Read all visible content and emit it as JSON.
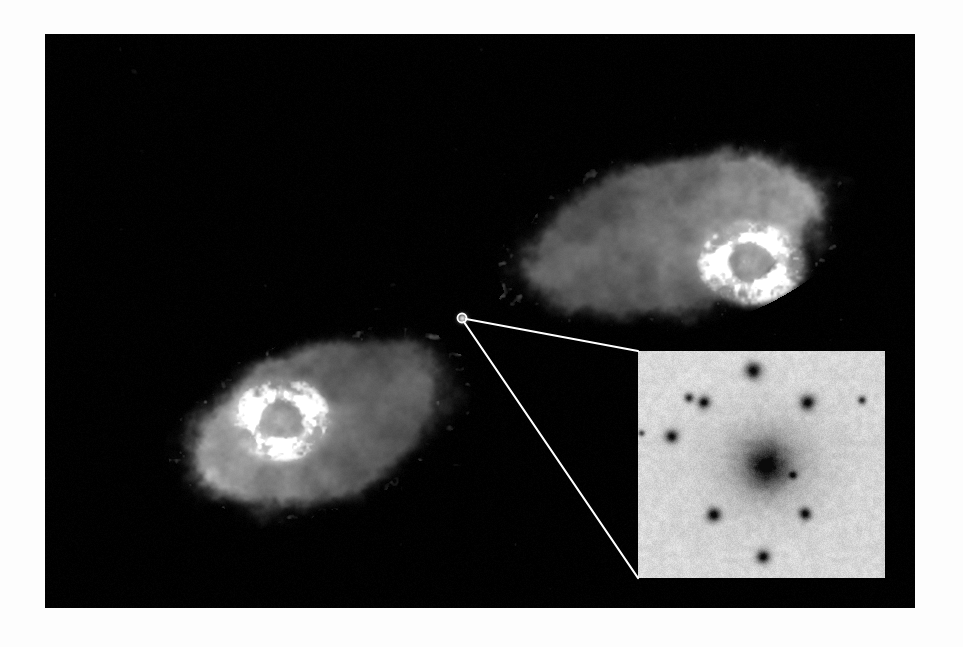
{
  "figure": {
    "kind": "astronomical-image",
    "description": "Greyscale radio map of a double-lobed radio galaxy with an optical inset of the host galaxy",
    "background_color": "#ffffff",
    "frame": {
      "x": 45,
      "y": 34,
      "width": 870,
      "height": 574,
      "background_color": "#000000",
      "border_color": "#000000"
    },
    "visible_text": [],
    "annotations": {
      "core_marker": {
        "label": "radio-core-marker",
        "shape": "small open circle",
        "x": 417,
        "y": 284,
        "radius": 4.5,
        "color": "#ffffff"
      },
      "callout_lines": {
        "label": "inset-callout-lines",
        "color": "#ffffff",
        "width": 2.2,
        "lines": [
          {
            "x1": 421,
            "y1": 285,
            "x2": 593,
            "y2": 317
          },
          {
            "x1": 419,
            "y1": 288,
            "x2": 593,
            "y2": 544
          }
        ]
      }
    },
    "radio_map": {
      "label": "radio-continuum-map",
      "colormap": "linear greyscale, black = zero intensity, white = peak",
      "components": [
        {
          "name": "north-east-lobe",
          "center_x": 630,
          "center_y": 203,
          "extent_x": 260,
          "extent_y": 130,
          "position_angle_deg": -14,
          "peak_region": "hotspot at east end",
          "hotspot": {
            "x": 705,
            "y": 228,
            "rx": 52,
            "ry": 40,
            "peak_level": 1.0
          }
        },
        {
          "name": "south-west-lobe",
          "center_x": 275,
          "center_y": 388,
          "extent_x": 225,
          "extent_y": 135,
          "position_angle_deg": -20,
          "peak_region": "hotspot at west end",
          "hotspot": {
            "x": 236,
            "y": 385,
            "rx": 48,
            "ry": 42,
            "peak_level": 1.0
          }
        },
        {
          "name": "radio-core",
          "center_x": 417,
          "center_y": 284,
          "extent_x": 7,
          "extent_y": 7,
          "peak_level": 0.85
        }
      ],
      "levels": {
        "faint_halo": 0.28,
        "mid_plateau": 0.45,
        "bright_filament": 0.8,
        "peak": 1.0
      }
    },
    "optical_inset": {
      "label": "optical-inset-host-galaxy",
      "x": 593,
      "y": 317,
      "width": 247,
      "height": 227,
      "polarity": "negative (dark sources on light sky)",
      "sky_color": "#dcdcd8",
      "source_color": "#101010",
      "galaxy": {
        "name": "host-galaxy",
        "cx": 0.52,
        "cy": 0.5,
        "core_rx": 0.085,
        "core_ry": 0.095,
        "halo_rx": 0.3,
        "halo_ry": 0.28,
        "core_darkness": 1.0
      },
      "stars": [
        {
          "cx": 0.465,
          "cy": 0.085,
          "r": 0.035,
          "darkness": 0.95
        },
        {
          "cx": 0.205,
          "cy": 0.205,
          "r": 0.02,
          "darkness": 0.8
        },
        {
          "cx": 0.265,
          "cy": 0.225,
          "r": 0.026,
          "darkness": 0.92
        },
        {
          "cx": 0.685,
          "cy": 0.225,
          "r": 0.031,
          "darkness": 0.95
        },
        {
          "cx": 0.905,
          "cy": 0.215,
          "r": 0.017,
          "darkness": 0.78
        },
        {
          "cx": 0.135,
          "cy": 0.375,
          "r": 0.028,
          "darkness": 0.9
        },
        {
          "cx": 0.305,
          "cy": 0.72,
          "r": 0.029,
          "darkness": 0.93
        },
        {
          "cx": 0.675,
          "cy": 0.715,
          "r": 0.026,
          "darkness": 0.9
        },
        {
          "cx": 0.505,
          "cy": 0.905,
          "r": 0.028,
          "darkness": 0.93
        },
        {
          "cx": 0.625,
          "cy": 0.545,
          "r": 0.017,
          "darkness": 0.7
        },
        {
          "cx": 0.013,
          "cy": 0.36,
          "r": 0.014,
          "darkness": 0.7
        }
      ],
      "noise_amplitude": 0.11
    }
  }
}
